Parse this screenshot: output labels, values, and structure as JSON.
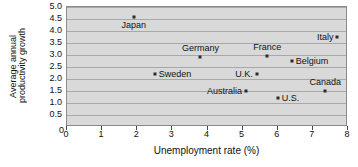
{
  "chart_data": {
    "type": "scatter",
    "title": "",
    "xlabel": "Unemployment rate (%)",
    "ylabel": "Average annual productivity growth",
    "ylabel_lines": [
      "Average annual",
      "productivity growth"
    ],
    "xlim": [
      0,
      8
    ],
    "ylim": [
      0,
      5.0
    ],
    "xticks": [
      0,
      1,
      2,
      3,
      4,
      5,
      6,
      7,
      8
    ],
    "xtick_labels": [
      "0",
      "1",
      "2",
      "3",
      "4",
      "5",
      "6",
      "7",
      "8"
    ],
    "yticks": [
      0,
      0.5,
      1.0,
      1.5,
      2.0,
      2.5,
      3.0,
      3.5,
      4.0,
      4.5,
      5.0
    ],
    "ytick_labels": [
      "0",
      "0.5",
      "1.0",
      "1.5",
      "2.0",
      "2.5",
      "3.0",
      "3.5",
      "4.0",
      "4.5",
      "5.0"
    ],
    "grid": "horizontal",
    "legend": "none",
    "plot_background": "#d9d9d9",
    "gridline_color": "#a8a8a8",
    "marker_color": "#2b2b2b",
    "points": [
      {
        "label": "Japan",
        "x": 1.9,
        "y": 4.6,
        "label_pos": "below"
      },
      {
        "label": "Sweden",
        "x": 2.5,
        "y": 2.2,
        "label_pos": "right"
      },
      {
        "label": "Germany",
        "x": 3.8,
        "y": 2.9,
        "label_pos": "above"
      },
      {
        "label": "Australia",
        "x": 5.1,
        "y": 1.5,
        "label_pos": "left"
      },
      {
        "label": "U.K.",
        "x": 5.4,
        "y": 2.2,
        "label_pos": "left"
      },
      {
        "label": "France",
        "x": 5.7,
        "y": 2.95,
        "label_pos": "above"
      },
      {
        "label": "U.S.",
        "x": 6.0,
        "y": 1.2,
        "label_pos": "right"
      },
      {
        "label": "Belgium",
        "x": 6.4,
        "y": 2.75,
        "label_pos": "right"
      },
      {
        "label": "Canada",
        "x": 7.35,
        "y": 1.5,
        "label_pos": "above"
      },
      {
        "label": "Italy",
        "x": 7.7,
        "y": 3.75,
        "label_pos": "left"
      }
    ]
  }
}
